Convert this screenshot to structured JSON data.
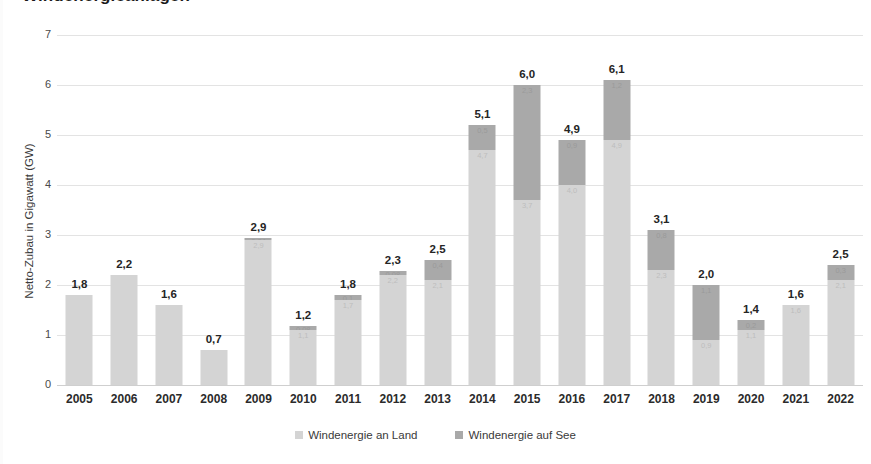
{
  "chart_data": {
    "type": "bar",
    "subtype": "stacked-bar",
    "title": "Windenergieanlagen",
    "xlabel": "",
    "ylabel": "Netto-Zubau in Gigawatt (GW)",
    "ylim": [
      0,
      7
    ],
    "yticks": [
      "0",
      "1",
      "2",
      "3",
      "4",
      "5",
      "6",
      "7"
    ],
    "grid": true,
    "legend_position": "bottom",
    "categories": [
      "2005",
      "2006",
      "2007",
      "2008",
      "2009",
      "2010",
      "2011",
      "2012",
      "2013",
      "2014",
      "2015",
      "2016",
      "2017",
      "2018",
      "2019",
      "2020",
      "2021",
      "2022"
    ],
    "series": [
      {
        "name": "Windenergie an Land",
        "color": "#d4d4d4",
        "values": [
          1.8,
          2.2,
          1.6,
          0.7,
          2.9,
          1.1,
          1.7,
          2.2,
          2.1,
          4.7,
          3.7,
          4.0,
          4.9,
          2.3,
          0.9,
          1.1,
          1.6,
          2.1
        ],
        "labels": [
          "",
          "",
          "",
          "",
          "2,9",
          "1,1",
          "1,7",
          "2,2",
          "2,1",
          "4,7",
          "3,7",
          "4,0",
          "4,9",
          "2,3",
          "0,9",
          "1,1",
          "1,6",
          "2,1"
        ]
      },
      {
        "name": "Windenergie auf See",
        "color": "#a9a9a9",
        "values": [
          0,
          0,
          0,
          0,
          0.04,
          0.08,
          0.1,
          0.08,
          0.4,
          0.5,
          2.3,
          0.9,
          1.2,
          0.8,
          1.1,
          0.2,
          0.0,
          0.3
        ],
        "labels": [
          "",
          "",
          "",
          "",
          "0,04",
          "0,08",
          "0,1",
          "0,08",
          "0,4",
          "0,5",
          "2,3",
          "0,9",
          "1,2",
          "0,8",
          "1,1",
          "0,2",
          "",
          "0,3"
        ]
      }
    ],
    "totals": [
      1.8,
      2.2,
      1.6,
      0.7,
      2.9,
      1.2,
      1.8,
      2.3,
      2.5,
      5.1,
      6.0,
      4.9,
      6.1,
      3.1,
      2.0,
      1.4,
      1.6,
      2.5
    ],
    "total_labels": [
      "1,8",
      "2,2",
      "1,6",
      "0,7",
      "2,9",
      "1,2",
      "1,8",
      "2,3",
      "2,5",
      "5,1",
      "6,0",
      "4,9",
      "6,1",
      "3,1",
      "2,0",
      "1,4",
      "1,6",
      "2,5"
    ]
  },
  "legend": {
    "items": [
      {
        "label": "Windenergie an Land",
        "color": "#d4d4d4"
      },
      {
        "label": "Windenergie auf See",
        "color": "#a9a9a9"
      }
    ]
  }
}
